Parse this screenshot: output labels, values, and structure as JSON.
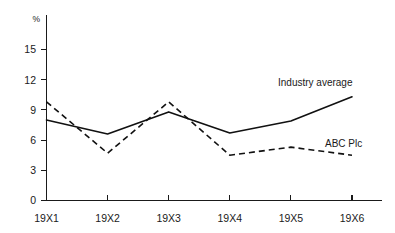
{
  "chart_data": {
    "type": "line",
    "title": "",
    "xlabel": "",
    "ylabel": "%",
    "categories": [
      "19X1",
      "19X2",
      "19X3",
      "19X4",
      "19X5",
      "19X6"
    ],
    "yticks": [
      0,
      3,
      6,
      9,
      12,
      15
    ],
    "ylim": [
      0,
      16.5
    ],
    "grid": false,
    "legend_position": "inline-right",
    "series": [
      {
        "name": "Industry average",
        "style": "solid",
        "color": "#111111",
        "values": [
          8.0,
          6.6,
          8.8,
          6.7,
          7.9,
          10.3
        ]
      },
      {
        "name": "ABC Plc",
        "style": "dashed",
        "color": "#111111",
        "values": [
          9.8,
          4.7,
          9.8,
          4.5,
          5.3,
          4.5
        ]
      }
    ],
    "annotations": [
      {
        "text": "Industry average",
        "series": "Industry average"
      },
      {
        "text": "ABC Plc",
        "series": "ABC Plc"
      }
    ]
  },
  "axis": {
    "unit_symbol": "%",
    "y_tick_labels": [
      "0",
      "3",
      "6",
      "9",
      "12",
      "15"
    ],
    "x_tick_labels": [
      "19X1",
      "19X2",
      "19X3",
      "19X4",
      "19X5",
      "19X6"
    ]
  }
}
